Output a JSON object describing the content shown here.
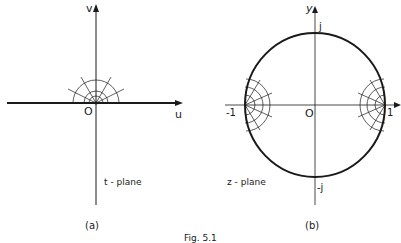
{
  "figure": {
    "caption": "Fig. 5.1",
    "ink_color": "#1a1a1a",
    "panels": [
      {
        "id": "a",
        "label": "(a)",
        "plane_label": "t - plane",
        "axes": {
          "horizontal": "u",
          "vertical": "v",
          "origin": "O"
        }
      },
      {
        "id": "b",
        "label": "(b)",
        "plane_label": "z - plane",
        "axes": {
          "horizontal": "",
          "vertical": "y",
          "origin": "O"
        },
        "points": {
          "top": "j",
          "bottom": "-j",
          "left": "-1",
          "right": "1"
        }
      }
    ]
  }
}
